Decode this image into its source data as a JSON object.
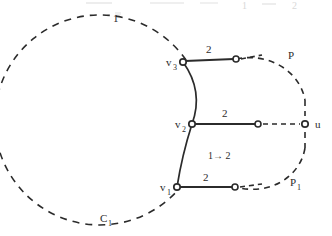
{
  "figure": {
    "type": "graph-diagram",
    "background": "#ffffff",
    "ink_color": "#2b2b2b",
    "labels": {
      "circle_top": "1",
      "circle_bottom": "C",
      "circle_bottom_sub": "1",
      "arc_transition": "1→ 2",
      "path_upper": "P",
      "path_lower": "P",
      "path_lower_sub": "1",
      "vertex_u": "u",
      "v3": "v",
      "v3_sub": "3",
      "v2": "v",
      "v2_sub": "2",
      "v1": "v",
      "v1_sub": "1",
      "edge_weight_top": "2",
      "edge_weight_mid": "2",
      "edge_weight_bottom": "2"
    },
    "ghost_artifacts": {
      "top_right_1": "1",
      "top_right_2": "2"
    },
    "nodes": [
      {
        "name": "v3",
        "x": 183,
        "y": 62,
        "style": "open-circle"
      },
      {
        "name": "v2",
        "x": 192,
        "y": 124,
        "style": "open-circle"
      },
      {
        "name": "v1",
        "x": 177,
        "y": 187,
        "style": "open-circle"
      },
      {
        "name": "e3",
        "x": 236,
        "y": 59,
        "style": "open-circle"
      },
      {
        "name": "e2",
        "x": 258,
        "y": 124,
        "style": "open-circle"
      },
      {
        "name": "e1",
        "x": 235,
        "y": 187,
        "style": "open-circle"
      },
      {
        "name": "u",
        "x": 305,
        "y": 124,
        "style": "open-circle"
      }
    ],
    "solid_edges": [
      {
        "from": "v3",
        "to": "e3",
        "weight": "2"
      },
      {
        "from": "v2",
        "to": "e2",
        "weight": "2"
      },
      {
        "from": "v1",
        "to": "e1",
        "weight": "2"
      }
    ],
    "dashed_circle": {
      "cx": 127,
      "cy": 120,
      "r": 105
    },
    "solid_arc": {
      "from": "v3",
      "to": "v1",
      "bulge": "right",
      "label": "1→ 2"
    }
  }
}
